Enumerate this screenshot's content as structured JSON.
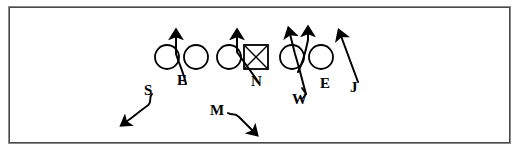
{
  "diagram": {
    "type": "football-play",
    "background_color": "#ffffff",
    "ink_color": "#000000",
    "border_color": "#8a8a8a",
    "border": {
      "x": 8,
      "y": 6,
      "width": 503,
      "height": 138
    },
    "offense": {
      "description": "Offensive line shown as circles with the center as a boxed X",
      "players": [
        {
          "id": "ol-1",
          "shape": "circle",
          "cx": 167,
          "cy": 57,
          "r": 12
        },
        {
          "id": "ol-2",
          "shape": "circle",
          "cx": 196,
          "cy": 57,
          "r": 12
        },
        {
          "id": "ol-3",
          "shape": "circle",
          "cx": 229,
          "cy": 57,
          "r": 12
        },
        {
          "id": "center",
          "shape": "square-x",
          "cx": 256,
          "cy": 57,
          "size": 24
        },
        {
          "id": "ol-4",
          "shape": "circle",
          "cx": 292,
          "cy": 57,
          "r": 12
        },
        {
          "id": "ol-5",
          "shape": "circle",
          "cx": 321,
          "cy": 57,
          "r": 12
        }
      ]
    },
    "defenders": [
      {
        "key": "E-left",
        "label": "E",
        "position_name": "defensive-end-left",
        "label_x": 182,
        "label_y": 80,
        "label_size": 15,
        "path_type": "curved-rush",
        "direction": "up",
        "path": "M 186 84 C 184 74, 180 66, 176 54 L 176 36"
      },
      {
        "key": "N",
        "label": "N",
        "position_name": "nose-tackle",
        "label_x": 256,
        "label_y": 81,
        "label_size": 15,
        "path_type": "curved-rush",
        "direction": "up",
        "path": "M 258 82 C 252 72, 245 64, 237 52 L 237 36"
      },
      {
        "key": "W",
        "label": "W",
        "position_name": "weak-linebacker",
        "label_x": 297,
        "label_y": 101,
        "label_size": 15,
        "path_type": "crossing-blitz",
        "direction": "up",
        "path": "M 306 94 C 302 80, 300 70, 295 54 L 290 34"
      },
      {
        "key": "E-right",
        "label": "E",
        "position_name": "defensive-end-right",
        "label_x": 324,
        "label_y": 85,
        "label_size": 15,
        "path_type": "crossing-rush",
        "direction": "up",
        "path": "M 298 72 C 304 60, 306 50, 308 40 L 308 33"
      },
      {
        "key": "J",
        "label": "J",
        "position_name": "jack-linebacker",
        "label_x": 353,
        "label_y": 89,
        "label_size": 15,
        "path_type": "straight-blitz",
        "direction": "up-left",
        "path": "M 358 82 L 341 36"
      },
      {
        "key": "S",
        "label": "S",
        "position_name": "strong-safety",
        "label_x": 148,
        "label_y": 91,
        "label_size": 15,
        "path_type": "squiggle-drop",
        "direction": "down-left",
        "path": "M 152 94 C 148 98, 152 102, 147 106 C 140 110, 133 116, 126 122"
      },
      {
        "key": "M",
        "label": "M",
        "position_name": "mike-linebacker",
        "label_x": 215,
        "label_y": 112,
        "label_size": 15,
        "path_type": "squiggle-drop",
        "direction": "down-right",
        "path": "M 228 113 C 232 116, 235 113, 239 117 C 243 121, 248 126, 253 131"
      }
    ],
    "arrow_count": 8,
    "legend_note": ""
  }
}
